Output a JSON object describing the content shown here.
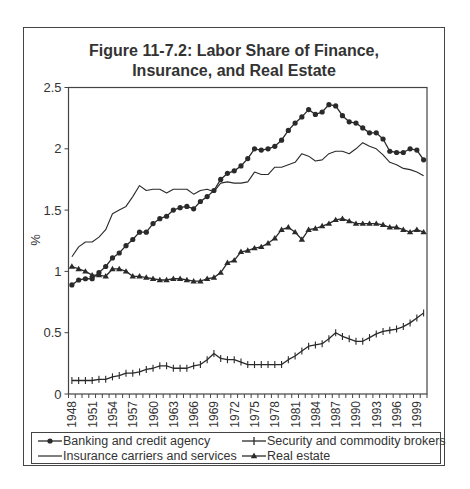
{
  "chart_data": {
    "type": "line",
    "title": "Figure 11-7.2:  Labor Share of Finance, Insurance, and Real Estate",
    "title_lines": [
      "Figure 11-7.2:  Labor Share of Finance,",
      "Insurance, and Real Estate"
    ],
    "xlabel": "",
    "ylabel": "%",
    "ylim": [
      0,
      2.5
    ],
    "yticks": [
      0,
      0.5,
      1,
      1.5,
      2,
      2.5
    ],
    "ytick_labels": [
      "0",
      "0.5",
      "1",
      "1.5",
      "2",
      "2.5"
    ],
    "x": [
      1948,
      1949,
      1950,
      1951,
      1952,
      1953,
      1954,
      1955,
      1956,
      1957,
      1958,
      1959,
      1960,
      1961,
      1962,
      1963,
      1964,
      1965,
      1966,
      1967,
      1968,
      1969,
      1970,
      1971,
      1972,
      1973,
      1974,
      1975,
      1976,
      1977,
      1978,
      1979,
      1980,
      1981,
      1982,
      1983,
      1984,
      1985,
      1986,
      1987,
      1988,
      1989,
      1990,
      1991,
      1992,
      1993,
      1994,
      1995,
      1996,
      1997,
      1998,
      1999,
      2000
    ],
    "xtick_labels": [
      "1948",
      "1951",
      "1954",
      "1957",
      "1960",
      "1963",
      "1966",
      "1969",
      "1972",
      "1975",
      "1978",
      "1981",
      "1984",
      "1987",
      "1990",
      "1993",
      "1996",
      "1999"
    ],
    "grid": false,
    "legend_position": "bottom",
    "series": [
      {
        "name": "Banking and credit agency",
        "marker": "circle",
        "values": [
          0.89,
          0.93,
          0.94,
          0.94,
          0.99,
          1.04,
          1.11,
          1.15,
          1.21,
          1.26,
          1.32,
          1.32,
          1.39,
          1.43,
          1.45,
          1.5,
          1.52,
          1.53,
          1.51,
          1.57,
          1.61,
          1.66,
          1.75,
          1.8,
          1.82,
          1.86,
          1.92,
          2.0,
          1.99,
          2.0,
          2.02,
          2.07,
          2.15,
          2.21,
          2.26,
          2.32,
          2.28,
          2.3,
          2.36,
          2.35,
          2.27,
          2.22,
          2.21,
          2.17,
          2.13,
          2.13,
          2.08,
          1.98,
          1.97,
          1.97,
          2.0,
          1.99,
          1.91
        ]
      },
      {
        "name": "Security and commodity brokers",
        "marker": "plus",
        "values": [
          0.11,
          0.11,
          0.11,
          0.11,
          0.12,
          0.12,
          0.14,
          0.15,
          0.17,
          0.17,
          0.18,
          0.2,
          0.21,
          0.23,
          0.23,
          0.21,
          0.21,
          0.21,
          0.23,
          0.24,
          0.28,
          0.33,
          0.29,
          0.28,
          0.28,
          0.26,
          0.24,
          0.24,
          0.24,
          0.24,
          0.24,
          0.24,
          0.28,
          0.31,
          0.35,
          0.39,
          0.4,
          0.41,
          0.45,
          0.5,
          0.47,
          0.45,
          0.43,
          0.43,
          0.46,
          0.49,
          0.51,
          0.52,
          0.53,
          0.55,
          0.58,
          0.62,
          0.66
        ]
      },
      {
        "name": "Insurance carriers and services",
        "marker": "none",
        "values": [
          1.12,
          1.2,
          1.24,
          1.24,
          1.28,
          1.34,
          1.47,
          1.5,
          1.53,
          1.61,
          1.7,
          1.66,
          1.67,
          1.67,
          1.64,
          1.67,
          1.67,
          1.67,
          1.63,
          1.66,
          1.67,
          1.65,
          1.72,
          1.73,
          1.72,
          1.72,
          1.73,
          1.81,
          1.79,
          1.79,
          1.85,
          1.85,
          1.87,
          1.89,
          1.96,
          1.94,
          1.9,
          1.91,
          1.96,
          1.98,
          1.98,
          1.96,
          2.0,
          2.05,
          2.02,
          2.0,
          1.95,
          1.89,
          1.87,
          1.84,
          1.83,
          1.81,
          1.78
        ]
      },
      {
        "name": "Real estate",
        "marker": "triangle",
        "values": [
          1.04,
          1.02,
          1.0,
          0.97,
          0.97,
          0.96,
          1.02,
          1.02,
          1.0,
          0.96,
          0.96,
          0.95,
          0.94,
          0.93,
          0.93,
          0.94,
          0.94,
          0.93,
          0.92,
          0.92,
          0.94,
          0.95,
          0.99,
          1.07,
          1.09,
          1.16,
          1.17,
          1.19,
          1.2,
          1.23,
          1.27,
          1.34,
          1.36,
          1.32,
          1.26,
          1.34,
          1.35,
          1.37,
          1.39,
          1.42,
          1.43,
          1.41,
          1.39,
          1.39,
          1.39,
          1.39,
          1.38,
          1.36,
          1.36,
          1.34,
          1.32,
          1.34,
          1.32
        ]
      }
    ]
  },
  "colors": {
    "line": "#2a2a2a",
    "axis": "#444444",
    "text": "#333333"
  }
}
